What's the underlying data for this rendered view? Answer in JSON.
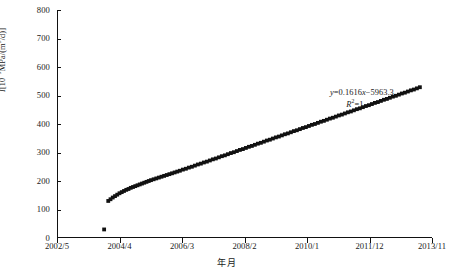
{
  "chart_data": {
    "type": "scatter",
    "title": "",
    "xlabel": "年月",
    "ylabel": "I[10-9MPa/(m3/d)]",
    "ylabel_parts": {
      "symbol": "I",
      "open": "[10",
      "exponent": "-9",
      "unit": "MPa/(m",
      "unit_exponent": "3",
      "close": "/d)]"
    },
    "grid": false,
    "legend": "none",
    "ylim": [
      0,
      800
    ],
    "yticks": [
      0,
      100,
      200,
      300,
      400,
      500,
      600,
      700,
      800
    ],
    "xticks": [
      "2002/5",
      "2004/4",
      "2006/3",
      "2008/2",
      "2010/1",
      "2011/12",
      "2013/11"
    ],
    "xlim_labels": [
      "2002/5",
      "2013/11"
    ],
    "marker": "square",
    "marker_color": "#111111",
    "marker_size": 1.9,
    "annotations": [
      {
        "text": "y=0.1616x-5963.3",
        "x_frac": 0.73,
        "y_frac": 0.55
      },
      {
        "text": "R2=1",
        "x_frac": 0.76,
        "y_frac": 0.5
      }
    ],
    "annotation_parts": {
      "eq_y": "y",
      "eq_body": "=0.1616",
      "eq_x": "x",
      "eq_tail": "−5963.3",
      "r2_symbol": "R",
      "r2_exponent": "2",
      "r2_value": "=1"
    },
    "series": [
      {
        "name": "I",
        "note": "isolated early point",
        "x": [
          0.123
        ],
        "values": [
          30
        ]
      },
      {
        "name": "I-main",
        "note": "rising curve then linear trend",
        "x": [
          0.134,
          0.14,
          0.146,
          0.152,
          0.158,
          0.164,
          0.17,
          0.176,
          0.182,
          0.188,
          0.194,
          0.2,
          0.206,
          0.212,
          0.218,
          0.224,
          0.23,
          0.236,
          0.242,
          0.248,
          0.255,
          0.262,
          0.269,
          0.276,
          0.283,
          0.29,
          0.297,
          0.304,
          0.311,
          0.318,
          0.325,
          0.333,
          0.341,
          0.349,
          0.357,
          0.365,
          0.373,
          0.381,
          0.389,
          0.397,
          0.405,
          0.413,
          0.421,
          0.429,
          0.437,
          0.445,
          0.453,
          0.461,
          0.469,
          0.477,
          0.485,
          0.493,
          0.501,
          0.509,
          0.517,
          0.525,
          0.533,
          0.541,
          0.549,
          0.557,
          0.565,
          0.573,
          0.581,
          0.589,
          0.597,
          0.605,
          0.613,
          0.621,
          0.629,
          0.637,
          0.645,
          0.653,
          0.661,
          0.669,
          0.677,
          0.685,
          0.693,
          0.701,
          0.709,
          0.717,
          0.725,
          0.733,
          0.741,
          0.749,
          0.757,
          0.765,
          0.773,
          0.781,
          0.789,
          0.797,
          0.805,
          0.813,
          0.821,
          0.829,
          0.837,
          0.845,
          0.853,
          0.861,
          0.869,
          0.877,
          0.885,
          0.893,
          0.901,
          0.909,
          0.917,
          0.925,
          0.933,
          0.941,
          0.949,
          0.957,
          0.965
        ],
        "values": [
          130,
          136,
          142,
          147,
          152,
          157,
          161,
          165,
          169,
          172,
          176,
          179,
          182,
          185,
          188,
          191,
          194,
          197,
          200,
          203,
          206,
          209,
          212,
          215,
          218,
          221,
          224,
          227,
          230,
          233,
          236,
          240,
          243,
          247,
          250,
          254,
          258,
          261,
          265,
          268,
          272,
          276,
          279,
          283,
          287,
          290,
          294,
          298,
          301,
          305,
          309,
          312,
          316,
          320,
          323,
          327,
          331,
          334,
          338,
          342,
          345,
          349,
          353,
          356,
          360,
          364,
          367,
          371,
          375,
          378,
          382,
          386,
          389,
          393,
          397,
          400,
          404,
          408,
          411,
          415,
          419,
          422,
          426,
          430,
          433,
          437,
          441,
          444,
          448,
          452,
          455,
          459,
          463,
          466,
          470,
          474,
          477,
          481,
          485,
          488,
          492,
          496,
          499,
          503,
          507,
          510,
          514,
          518,
          521,
          525,
          529
        ]
      }
    ]
  },
  "figure": {
    "caption": ""
  }
}
